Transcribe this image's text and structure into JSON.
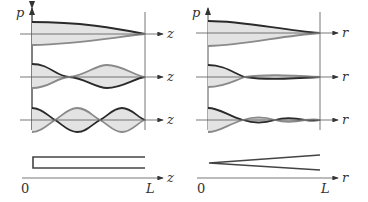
{
  "diagram": {
    "left_panel": {
      "y_axis_label": "p",
      "x_axis_label": "z",
      "origin_label": "0",
      "end_label": "L",
      "modes": [
        "mode 1",
        "mode 2",
        "mode 3"
      ],
      "geometry": "cylinder"
    },
    "right_panel": {
      "y_axis_label": "p",
      "x_axis_label": "r",
      "origin_label": "0",
      "end_label": "L",
      "modes": [
        "mode 1",
        "mode 2",
        "mode 3"
      ],
      "geometry": "cone"
    },
    "colors": {
      "dark_curve": "#2a2a2a",
      "light_curve": "#8a8a8a",
      "fill": "#e3e3e3",
      "axis": "#555555"
    }
  }
}
